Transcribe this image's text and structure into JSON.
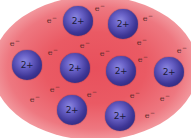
{
  "diagram": {
    "type": "metallic-bonding-electron-sea",
    "colors": {
      "electron_sea": "#e8505c",
      "ion_fill": "#3e3696",
      "ion_highlight": "#8c88e0",
      "electron_text": "#5a2a2a"
    },
    "ion_label": "2+",
    "electron_label": "e",
    "electron_charge": "−",
    "ions": [
      {
        "label": "2+",
        "x": 78,
        "y": 21
      },
      {
        "label": "2+",
        "x": 123,
        "y": 24
      },
      {
        "label": "2+",
        "x": 27,
        "y": 65
      },
      {
        "label": "2+",
        "x": 75,
        "y": 68
      },
      {
        "label": "2+",
        "x": 121,
        "y": 71
      },
      {
        "label": "2+",
        "x": 169,
        "y": 72
      },
      {
        "label": "2+",
        "x": 72,
        "y": 110
      },
      {
        "label": "2+",
        "x": 120,
        "y": 116
      }
    ],
    "electrons": [
      {
        "label": "e",
        "charge": "−",
        "x": 52,
        "y": 20
      },
      {
        "label": "e",
        "charge": "−",
        "x": 100,
        "y": 8
      },
      {
        "label": "e",
        "charge": "−",
        "x": 148,
        "y": 18
      },
      {
        "label": "e",
        "charge": "−",
        "x": 15,
        "y": 43
      },
      {
        "label": "e",
        "charge": "−",
        "x": 85,
        "y": 45
      },
      {
        "label": "e",
        "charge": "−",
        "x": 142,
        "y": 42
      },
      {
        "label": "e",
        "charge": "−",
        "x": 53,
        "y": 52
      },
      {
        "label": "e",
        "charge": "−",
        "x": 105,
        "y": 53
      },
      {
        "label": "e",
        "charge": "−",
        "x": 143,
        "y": 59
      },
      {
        "label": "e",
        "charge": "−",
        "x": 182,
        "y": 50
      },
      {
        "label": "e",
        "charge": "−",
        "x": 55,
        "y": 89
      },
      {
        "label": "e",
        "charge": "−",
        "x": 92,
        "y": 94
      },
      {
        "label": "e",
        "charge": "−",
        "x": 135,
        "y": 95
      },
      {
        "label": "e",
        "charge": "−",
        "x": 35,
        "y": 99
      },
      {
        "label": "e",
        "charge": "−",
        "x": 165,
        "y": 98
      },
      {
        "label": "e",
        "charge": "−",
        "x": 150,
        "y": 115
      }
    ]
  }
}
